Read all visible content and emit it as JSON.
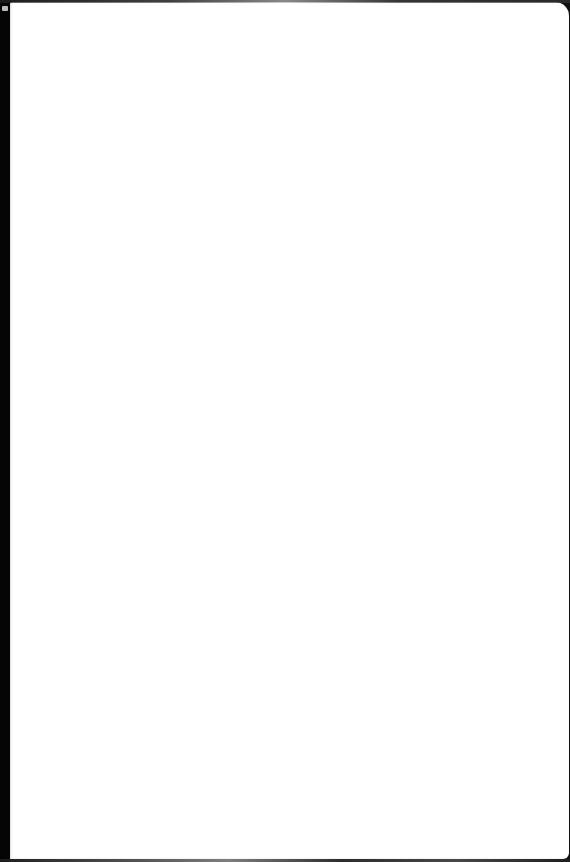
{
  "document": {
    "type": "blank-page",
    "text": ""
  },
  "colors": {
    "paper": "#ffffff",
    "background": "#0a0a0a"
  }
}
